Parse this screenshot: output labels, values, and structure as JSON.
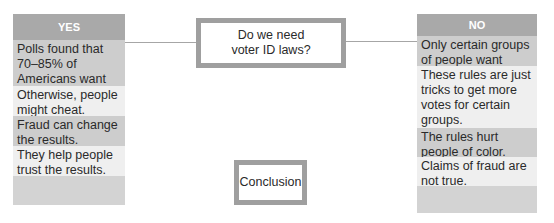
{
  "diagram": {
    "question": "Do we need voter ID laws?",
    "conclusion": "Conclusion",
    "yes": {
      "header": "YES",
      "items": [
        "Polls found that 70–85% of Americans want them.",
        "Otherwise, people might cheat.",
        "Fraud can change the results.",
        "They help people trust the results.",
        ""
      ]
    },
    "no": {
      "header": "NO",
      "items": [
        "Only certain groups of people want them.",
        "These rules are just tricks to get more votes for certain groups.",
        "The rules hurt people of color.",
        "Claims of fraud are not true.",
        ""
      ]
    },
    "colors": {
      "header_bg": "#a9a9a9",
      "row_dark": "#cdcdcd",
      "row_light": "#efefef",
      "box_border": "#9f9f9f",
      "connector": "#a6a6a6"
    }
  }
}
